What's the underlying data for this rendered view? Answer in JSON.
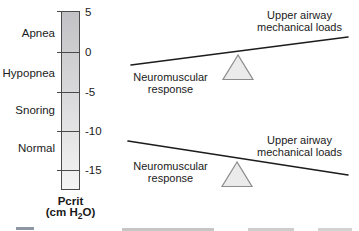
{
  "pcrit_scale": {
    "title": "Pcrit",
    "units_prefix": "(cm H",
    "units_sub": "2",
    "units_suffix": "O)",
    "categories": [
      {
        "label": "Apnea"
      },
      {
        "label": "Hypopnea"
      },
      {
        "label": "Snoring"
      },
      {
        "label": "Normal"
      }
    ],
    "ticks": [
      {
        "label": "5",
        "value": 5
      },
      {
        "label": "0",
        "value": 0
      },
      {
        "label": "-5",
        "value": -5
      },
      {
        "label": "-10",
        "value": -10
      },
      {
        "label": "-15",
        "value": -15
      }
    ]
  },
  "balances": [
    {
      "position": "top",
      "tilt": "up-to-right",
      "left_label": [
        "Neuromuscular",
        "response"
      ],
      "right_label": [
        "Upper airway",
        "mechanical loads"
      ]
    },
    {
      "position": "bottom",
      "tilt": "down-to-right",
      "left_label": [
        "Neuromuscular",
        "response"
      ],
      "right_label": [
        "Upper airway",
        "mechanical loads"
      ]
    }
  ],
  "colors": {
    "bar_gradient_top": "#c2c2c6",
    "bar_gradient_bottom": "#f4f4f4",
    "bar_border": "#4a4a4a",
    "beam_line": "#1c1c1c",
    "fulcrum_fill": "#ebebeb",
    "fulcrum_stroke": "#8c8c8c"
  }
}
